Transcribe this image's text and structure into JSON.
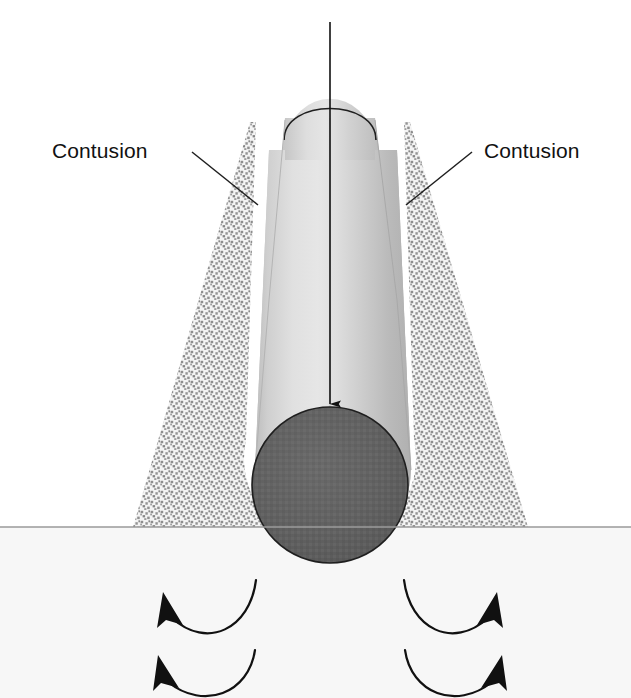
{
  "figure": {
    "background_color": "#ffffff",
    "labels": {
      "left": "Contusion",
      "right": "Contusion"
    },
    "colors": {
      "stipple_dot": "#8c8c8c",
      "stipple_background": "#f2f2f2",
      "cylinder_light": "#e3e3e3",
      "cylinder_mid": "#c9c9c9",
      "cylinder_shadow": "#a8a8a8",
      "end_face": "#5e5e5e",
      "outline": "#1a1a1a",
      "baseline": "#9a9a9a",
      "label_text": "#111111",
      "halo": "#ffffff"
    },
    "elements": {
      "impact_arrow": "downward-impact-arrow",
      "end_face": "cylinder-end-face",
      "baseline": "tissue-surface-line",
      "left_contusion_zone": "left-contusion-zone",
      "right_contusion_zone": "right-contusion-zone",
      "curved_arrows_count": 4
    },
    "geometry": {
      "baseline_y": 527,
      "cylinder_top_y": 95,
      "cylinder_axis_x": 330,
      "end_face_center_x": 330,
      "end_face_center_y": 485,
      "end_face_radius": 78,
      "arrow_start_y": 22,
      "arrow_tip_y": 415
    }
  }
}
